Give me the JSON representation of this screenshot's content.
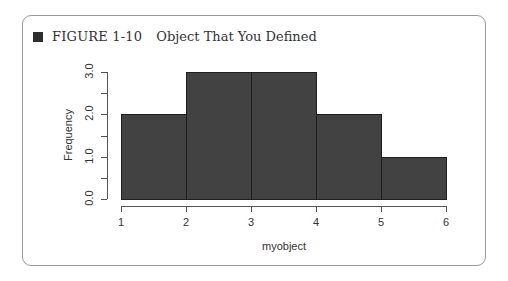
{
  "figure": {
    "label": "FIGURE 1-10",
    "title": "Object That You Defined"
  },
  "chart_data": {
    "type": "bar",
    "subtype": "histogram",
    "title": "",
    "xlabel": "myobject",
    "ylabel": "Frequency",
    "bins": [
      [
        1,
        2
      ],
      [
        2,
        3
      ],
      [
        3,
        4
      ],
      [
        4,
        5
      ],
      [
        5,
        6
      ]
    ],
    "categories": [
      "1-2",
      "2-3",
      "3-4",
      "4-5",
      "5-6"
    ],
    "values": [
      2,
      3,
      3,
      2,
      1
    ],
    "xlim": [
      1,
      6
    ],
    "ylim": [
      0,
      3
    ],
    "x_ticks": [
      "1",
      "2",
      "3",
      "4",
      "5",
      "6"
    ],
    "y_ticks": [
      "0.0",
      "1.0",
      "2.0",
      "3.0"
    ],
    "y_minor_ticks": [
      0.5,
      1.5,
      2.5
    ],
    "grid": false,
    "legend": null,
    "bar_color": "#424242"
  }
}
